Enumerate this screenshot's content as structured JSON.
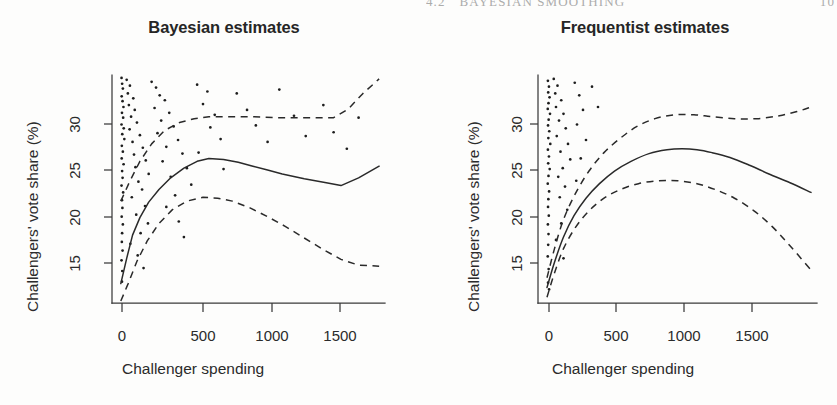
{
  "running_head": {
    "section": "4.2",
    "title": "BAYESIAN SMOOTHING",
    "page": "10"
  },
  "axis": {
    "ylabel": "Challengers' vote share (%)",
    "xlabel": "Challenger spending",
    "yticks": [
      "15",
      "20",
      "25",
      "30"
    ],
    "xticks": [
      "0",
      "500",
      "1000",
      "1500"
    ]
  },
  "panels": [
    {
      "id": "bayesian",
      "title": "Bayesian estimates"
    },
    {
      "id": "frequentist",
      "title": "Frequentist estimates"
    }
  ],
  "chart_data": [
    {
      "type": "scatter",
      "title": "Bayesian estimates",
      "xlabel": "Challenger spending",
      "ylabel": "Challengers' vote share (%)",
      "xlim": [
        -60,
        1800
      ],
      "ylim": [
        11.0,
        34.5
      ],
      "xticks": [
        0,
        500,
        1000,
        1500
      ],
      "yticks": [
        15,
        20,
        25,
        30
      ],
      "grid": false,
      "legend": false,
      "series": [
        {
          "name": "posterior mean",
          "style": "solid",
          "x": [
            0,
            40,
            80,
            130,
            190,
            260,
            340,
            430,
            520,
            600,
            700,
            800,
            900,
            1000,
            1100,
            1250,
            1400,
            1500,
            1620,
            1760
          ],
          "y": [
            13.0,
            15.6,
            18.0,
            19.8,
            21.4,
            22.7,
            23.9,
            24.9,
            25.6,
            25.9,
            25.8,
            25.5,
            25.1,
            24.7,
            24.3,
            23.8,
            23.4,
            23.1,
            23.9,
            25.1
          ]
        },
        {
          "name": "upper credible bound",
          "style": "dashed",
          "x": [
            0,
            60,
            130,
            210,
            300,
            400,
            500,
            600,
            750,
            900,
            1050,
            1200,
            1350,
            1450,
            1550,
            1650,
            1760
          ],
          "y": [
            21.5,
            23.5,
            25.6,
            27.4,
            28.8,
            29.6,
            30.0,
            30.2,
            30.2,
            30.2,
            30.1,
            30.1,
            30.1,
            30.1,
            31.0,
            32.6,
            34.1
          ]
        },
        {
          "name": "lower credible bound",
          "style": "dashed",
          "x": [
            0,
            50,
            110,
            180,
            260,
            350,
            450,
            560,
            660,
            760,
            880,
            1000,
            1120,
            1250,
            1380,
            1500,
            1620,
            1760
          ],
          "y": [
            11.2,
            13.0,
            15.3,
            17.4,
            19.2,
            20.6,
            21.5,
            21.9,
            21.8,
            21.5,
            20.8,
            19.9,
            18.9,
            17.7,
            16.5,
            15.5,
            14.9,
            14.8
          ]
        }
      ],
      "points": [
        [
          5,
          34.2
        ],
        [
          9,
          33.6
        ],
        [
          14,
          33.1
        ],
        [
          6,
          32.3
        ],
        [
          12,
          31.8
        ],
        [
          18,
          31.2
        ],
        [
          8,
          30.6
        ],
        [
          16,
          30.1
        ],
        [
          5,
          29.4
        ],
        [
          20,
          29.0
        ],
        [
          10,
          28.4
        ],
        [
          24,
          27.9
        ],
        [
          7,
          27.2
        ],
        [
          14,
          26.6
        ],
        [
          6,
          25.9
        ],
        [
          19,
          25.3
        ],
        [
          9,
          24.6
        ],
        [
          12,
          23.9
        ],
        [
          5,
          23.1
        ],
        [
          16,
          22.4
        ],
        [
          8,
          21.6
        ],
        [
          11,
          20.8
        ],
        [
          6,
          19.9
        ],
        [
          14,
          19.1
        ],
        [
          9,
          18.2
        ],
        [
          7,
          17.3
        ],
        [
          12,
          16.4
        ],
        [
          5,
          15.4
        ],
        [
          10,
          14.3
        ],
        [
          8,
          13.2
        ],
        [
          40,
          34.0
        ],
        [
          62,
          33.4
        ],
        [
          48,
          32.6
        ],
        [
          85,
          32.1
        ],
        [
          55,
          31.4
        ],
        [
          95,
          30.9
        ],
        [
          70,
          30.2
        ],
        [
          110,
          29.6
        ],
        [
          60,
          28.9
        ],
        [
          130,
          28.3
        ],
        [
          80,
          27.6
        ],
        [
          150,
          27.0
        ],
        [
          90,
          26.3
        ],
        [
          170,
          25.7
        ],
        [
          100,
          25.0
        ],
        [
          190,
          24.3
        ],
        [
          120,
          23.5
        ],
        [
          145,
          22.7
        ],
        [
          75,
          21.9
        ],
        [
          165,
          21.0
        ],
        [
          105,
          20.1
        ],
        [
          185,
          19.2
        ],
        [
          135,
          18.2
        ],
        [
          65,
          17.1
        ],
        [
          115,
          15.9
        ],
        [
          155,
          14.6
        ],
        [
          210,
          33.8
        ],
        [
          240,
          33.2
        ],
        [
          265,
          32.4
        ],
        [
          300,
          31.9
        ],
        [
          230,
          31.1
        ],
        [
          330,
          30.6
        ],
        [
          275,
          29.8
        ],
        [
          360,
          29.2
        ],
        [
          250,
          28.5
        ],
        [
          390,
          27.8
        ],
        [
          310,
          27.1
        ],
        [
          420,
          26.4
        ],
        [
          285,
          25.6
        ],
        [
          450,
          24.9
        ],
        [
          340,
          24.0
        ],
        [
          480,
          23.2
        ],
        [
          370,
          22.1
        ],
        [
          310,
          20.9
        ],
        [
          395,
          19.4
        ],
        [
          430,
          17.8
        ],
        [
          520,
          33.5
        ],
        [
          590,
          32.8
        ],
        [
          560,
          31.5
        ],
        [
          640,
          30.4
        ],
        [
          610,
          29.1
        ],
        [
          680,
          27.9
        ],
        [
          530,
          26.5
        ],
        [
          700,
          24.8
        ],
        [
          790,
          32.6
        ],
        [
          860,
          30.9
        ],
        [
          920,
          29.3
        ],
        [
          1000,
          27.6
        ],
        [
          1080,
          33.0
        ],
        [
          1180,
          30.3
        ],
        [
          1260,
          28.2
        ],
        [
          1380,
          31.4
        ],
        [
          1450,
          28.6
        ],
        [
          1540,
          26.9
        ],
        [
          1620,
          30.1
        ]
      ]
    },
    {
      "type": "scatter",
      "title": "Frequentist estimates",
      "xlabel": "Challenger spending",
      "ylabel": "Challengers' vote share (%)",
      "xlim": [
        -60,
        1800
      ],
      "ylim": [
        11.0,
        34.5
      ],
      "xticks": [
        0,
        500,
        1000,
        1500
      ],
      "yticks": [
        15,
        20,
        25,
        30
      ],
      "grid": false,
      "legend": false,
      "series": [
        {
          "name": "fitted mean",
          "style": "solid",
          "x": [
            0,
            50,
            110,
            180,
            260,
            350,
            450,
            560,
            680,
            800,
            900,
            1000,
            1100,
            1220,
            1350,
            1480,
            1620,
            1760
          ],
          "y": [
            12.6,
            15.2,
            17.8,
            20.0,
            21.8,
            23.3,
            24.6,
            25.6,
            26.4,
            26.8,
            26.9,
            26.8,
            26.5,
            26.0,
            25.2,
            24.3,
            23.4,
            22.4
          ]
        },
        {
          "name": "upper confidence bound",
          "style": "dashed",
          "x": [
            0,
            50,
            110,
            190,
            280,
            380,
            490,
            600,
            720,
            850,
            980,
            1100,
            1250,
            1400,
            1550,
            1680,
            1760
          ],
          "y": [
            13.6,
            16.6,
            19.6,
            22.3,
            24.6,
            26.5,
            28.0,
            29.2,
            30.0,
            30.4,
            30.4,
            30.2,
            30.0,
            30.0,
            30.3,
            30.8,
            31.2
          ]
        },
        {
          "name": "lower confidence bound",
          "style": "dashed",
          "x": [
            0,
            50,
            110,
            190,
            280,
            380,
            490,
            610,
            740,
            870,
            1000,
            1120,
            1250,
            1380,
            1500,
            1620,
            1760
          ],
          "y": [
            11.6,
            14.1,
            16.6,
            18.8,
            20.5,
            21.8,
            22.7,
            23.3,
            23.6,
            23.6,
            23.3,
            22.7,
            21.8,
            20.5,
            18.9,
            16.9,
            14.4
          ]
        }
      ],
      "points": [
        [
          6,
          33.9
        ],
        [
          13,
          33.3
        ],
        [
          8,
          32.7
        ],
        [
          17,
          32.2
        ],
        [
          10,
          31.6
        ],
        [
          5,
          31.0
        ],
        [
          20,
          30.5
        ],
        [
          11,
          29.9
        ],
        [
          7,
          29.3
        ],
        [
          15,
          28.7
        ],
        [
          9,
          28.0
        ],
        [
          22,
          27.4
        ],
        [
          6,
          26.8
        ],
        [
          13,
          26.1
        ],
        [
          8,
          25.4
        ],
        [
          18,
          24.8
        ],
        [
          10,
          24.1
        ],
        [
          5,
          23.3
        ],
        [
          14,
          22.5
        ],
        [
          9,
          21.7
        ],
        [
          7,
          20.9
        ],
        [
          12,
          20.0
        ],
        [
          6,
          19.1
        ],
        [
          10,
          18.1
        ],
        [
          8,
          17.0
        ],
        [
          5,
          15.8
        ],
        [
          11,
          14.5
        ],
        [
          7,
          13.1
        ],
        [
          14,
          12.4
        ],
        [
          45,
          34.1
        ],
        [
          70,
          33.4
        ],
        [
          55,
          32.6
        ],
        [
          95,
          31.9
        ],
        [
          60,
          31.2
        ],
        [
          110,
          30.5
        ],
        [
          80,
          29.8
        ],
        [
          125,
          29.0
        ],
        [
          65,
          28.2
        ],
        [
          140,
          27.4
        ],
        [
          90,
          26.6
        ],
        [
          155,
          25.8
        ],
        [
          105,
          24.9
        ],
        [
          75,
          24.0
        ],
        [
          120,
          23.0
        ],
        [
          85,
          21.9
        ],
        [
          135,
          20.6
        ],
        [
          95,
          19.2
        ],
        [
          60,
          17.5
        ],
        [
          110,
          15.6
        ],
        [
          185,
          33.7
        ],
        [
          215,
          32.4
        ],
        [
          240,
          30.9
        ],
        [
          200,
          29.4
        ],
        [
          260,
          27.8
        ],
        [
          225,
          25.9
        ],
        [
          195,
          23.6
        ],
        [
          300,
          33.3
        ],
        [
          340,
          31.2
        ]
      ]
    }
  ]
}
